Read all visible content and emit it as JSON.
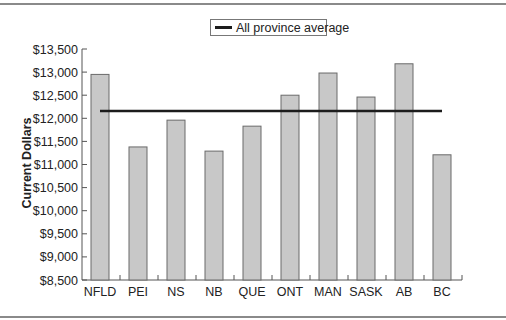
{
  "chart_data": {
    "type": "bar",
    "title": "",
    "xlabel": "",
    "ylabel": "Current Dollars",
    "categories": [
      "NFLD",
      "PEI",
      "NS",
      "NB",
      "QUE",
      "ONT",
      "MAN",
      "SASK",
      "AB",
      "BC"
    ],
    "series": [
      {
        "name": "Province",
        "type": "bar",
        "color": "#c8c8c8",
        "values": [
          12950,
          11380,
          11960,
          11290,
          11830,
          12500,
          12980,
          12460,
          13180,
          11210
        ]
      },
      {
        "name": "All province average",
        "type": "line",
        "color": "#1c1c1c",
        "values": [
          12160,
          12160,
          12160,
          12160,
          12160,
          12160,
          12160,
          12160,
          12160,
          12160
        ]
      }
    ],
    "ylim": [
      8500,
      13500
    ],
    "yticks": [
      8500,
      9000,
      9500,
      10000,
      10500,
      11000,
      11500,
      12000,
      12500,
      13000,
      13500
    ],
    "ytick_labels": [
      "$8,500",
      "$9,000",
      "$9,500",
      "$10,000",
      "$10,500",
      "$11,000",
      "$11,500",
      "$12,000",
      "$12,500",
      "$13,000",
      "$13,500"
    ],
    "grid": false,
    "legend": {
      "position": "top-center",
      "entries": [
        "All province average"
      ]
    }
  },
  "legend_label": "All province average",
  "ylabel": "Current Dollars"
}
